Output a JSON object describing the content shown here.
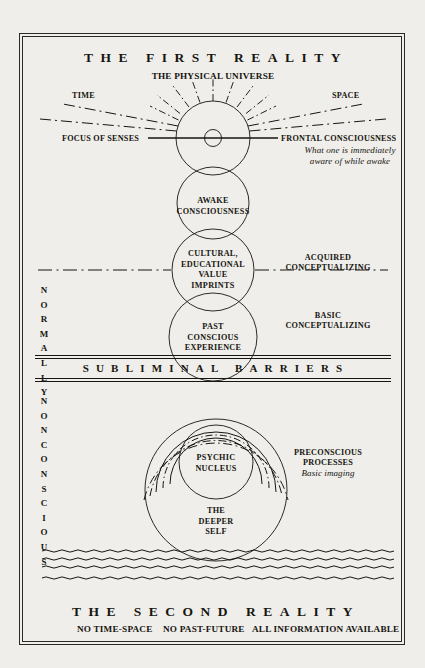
{
  "diagram": {
    "title_top": "THE FIRST REALITY",
    "title_bottom": "THE SECOND REALITY",
    "subtitle_top": "THE PHYSICAL UNIVERSE",
    "subtitle_bottom_1": "NO TIME-SPACE",
    "subtitle_bottom_2": "NO PAST-FUTURE",
    "subtitle_bottom_3": "ALL INFORMATION AVAILABLE",
    "barrier_band": "SUBLIMINAL BARRIERS",
    "axis_left_label": "TIME",
    "axis_right_label": "SPACE",
    "focus_label": "FOCUS OF SENSES",
    "frontal_label": "FRONTAL CONSCIOUSNESS",
    "frontal_note_line1": "What one is immediately",
    "frontal_note_line2": "aware of while awake",
    "side_left_word_1": "NORMALLY",
    "side_left_word_2": "NONCONSCIOUS",
    "right_labels": [
      {
        "line1": "ACQUIRED",
        "line2": "CONCEPTUALIZING"
      },
      {
        "line1": "BASIC",
        "line2": "CONCEPTUALIZING"
      },
      {
        "line1": "PRECONSCIOUS",
        "line2": "PROCESSES",
        "italic": "Basic imaging"
      }
    ],
    "circles": [
      {
        "name": "frontal-consciousness-circle",
        "label": "",
        "cx": 213,
        "cy": 138,
        "r": 37
      },
      {
        "name": "sense-focus-dot-circle",
        "label": "",
        "cx": 213,
        "cy": 138,
        "r": 8.5
      },
      {
        "name": "awake-consciousness-circle",
        "label": "AWAKE\nCONSCIOUSNESS",
        "cx": 213,
        "cy": 203,
        "r": 36
      },
      {
        "name": "cultural-imprints-circle",
        "label": "CULTURAL,\nEDUCATIONAL\nVALUE\nIMPRINTS",
        "cx": 213,
        "cy": 270,
        "r": 41
      },
      {
        "name": "past-conscious-experience-circle",
        "label": "PAST\nCONSCIOUS\nEXPERIENCE",
        "cx": 213,
        "cy": 337,
        "r": 44
      },
      {
        "name": "psychic-nucleus-circle",
        "label": "PSYCHIC\nNUCLEUS",
        "cx": 216,
        "cy": 462,
        "r": 37
      },
      {
        "name": "deeper-self-circle",
        "label": "THE\nDEEPER\nSELF",
        "cx": 216,
        "cy": 490,
        "r": 71
      }
    ],
    "colors": {
      "ink": "#17150f",
      "line": "#2a2a28",
      "paper": "#efeeea"
    }
  }
}
